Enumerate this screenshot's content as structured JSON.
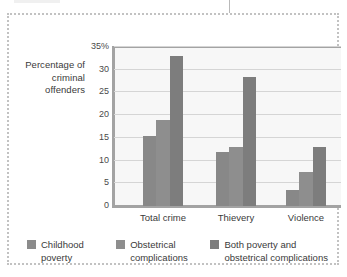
{
  "chart_data": {
    "type": "bar",
    "title": "",
    "xlabel": "",
    "ylabel": "Percentage\nof criminal\noffenders",
    "categories": [
      "Total crime",
      "Thievery",
      "Violence"
    ],
    "series": [
      {
        "name": "Childhood poverty",
        "values": [
          15.5,
          12.0,
          3.5
        ],
        "color": "#888888"
      },
      {
        "name": "Obstetrical complications",
        "values": [
          19.0,
          13.0,
          7.5
        ],
        "color": "#8e8e8e"
      },
      {
        "name": "Both poverty and obstetrical complications",
        "values": [
          33.0,
          28.5,
          13.0
        ],
        "color": "#7d7d7d"
      }
    ],
    "ylim": [
      0,
      35
    ],
    "yticks": [
      0,
      5,
      10,
      15,
      20,
      25,
      30,
      35
    ],
    "ytick_labels": [
      "0",
      "5",
      "10",
      "15",
      "20",
      "25",
      "30",
      "35%"
    ],
    "grid": true,
    "legend_position": "bottom"
  },
  "legend": {
    "items": [
      {
        "label": "Childhood\npoverty"
      },
      {
        "label": "Obstetrical\ncomplications"
      },
      {
        "label": "Both poverty and\nobstetrical complications"
      }
    ]
  }
}
